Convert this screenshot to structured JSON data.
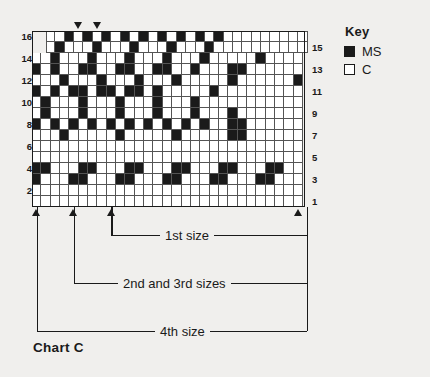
{
  "key": {
    "title": "Key",
    "items": [
      {
        "swatch": "ms",
        "label": "MS"
      },
      {
        "swatch": "c",
        "label": "C"
      }
    ]
  },
  "caption": "Chart C",
  "brackets": [
    {
      "label": "1st size"
    },
    {
      "label": "2nd and 3rd sizes"
    },
    {
      "label": "4th size"
    }
  ],
  "chart_data": {
    "type": "heatmap",
    "title": "Chart C",
    "xlabel": "",
    "ylabel": "",
    "columns": 29,
    "rows": 16,
    "legend_position": "right",
    "grid": true,
    "colors": {
      "ms": "#1a1a1a",
      "c": "#ffffff",
      "gridline": "#545454"
    },
    "row_labels_left": [
      "16",
      "14",
      "12",
      "10",
      "8",
      "6",
      "4",
      "2"
    ],
    "row_labels_right": [
      "15",
      "13",
      "11",
      "9",
      "7",
      "5",
      "3",
      "1"
    ],
    "cell_values": {
      "16": [
        0,
        0,
        1,
        0,
        1,
        0,
        1,
        0,
        1,
        0,
        1,
        0,
        1,
        0,
        1,
        0,
        1,
        0,
        1,
        0,
        0,
        0,
        0,
        0,
        0,
        0,
        0,
        0,
        0
      ],
      "15": [
        0,
        1,
        0,
        0,
        0,
        1,
        0,
        0,
        0,
        1,
        0,
        0,
        0,
        1,
        0,
        0,
        0,
        1,
        0,
        0,
        0,
        0,
        0,
        0,
        0,
        0,
        0,
        0,
        0
      ],
      "14": [
        0,
        0,
        1,
        0,
        0,
        0,
        1,
        0,
        0,
        0,
        1,
        0,
        0,
        0,
        1,
        0,
        0,
        0,
        1,
        0,
        0,
        0,
        0,
        0,
        1,
        0,
        0,
        0,
        0
      ],
      "13": [
        1,
        0,
        1,
        0,
        0,
        1,
        1,
        0,
        0,
        1,
        1,
        0,
        0,
        1,
        1,
        0,
        0,
        1,
        0,
        0,
        0,
        1,
        1,
        0,
        0,
        0,
        0,
        0,
        0
      ],
      "12": [
        0,
        0,
        0,
        1,
        0,
        0,
        0,
        1,
        0,
        0,
        0,
        1,
        0,
        0,
        0,
        1,
        0,
        0,
        0,
        0,
        0,
        1,
        0,
        0,
        0,
        0,
        0,
        0,
        1
      ],
      "11": [
        1,
        0,
        1,
        0,
        1,
        1,
        0,
        1,
        1,
        0,
        1,
        1,
        0,
        1,
        0,
        0,
        0,
        0,
        0,
        1,
        0,
        0,
        0,
        0,
        0,
        0,
        0,
        0,
        0
      ],
      "10": [
        0,
        1,
        0,
        0,
        0,
        1,
        0,
        0,
        0,
        1,
        0,
        0,
        0,
        1,
        0,
        0,
        0,
        1,
        0,
        0,
        0,
        0,
        0,
        0,
        0,
        0,
        0,
        0,
        0
      ],
      "9": [
        0,
        1,
        0,
        0,
        0,
        1,
        0,
        0,
        0,
        1,
        0,
        0,
        0,
        1,
        0,
        0,
        0,
        1,
        0,
        0,
        0,
        1,
        0,
        0,
        0,
        0,
        0,
        0,
        0
      ],
      "8": [
        1,
        0,
        1,
        0,
        1,
        0,
        1,
        0,
        1,
        0,
        1,
        0,
        1,
        0,
        1,
        0,
        1,
        0,
        1,
        0,
        0,
        1,
        1,
        0,
        0,
        0,
        0,
        0,
        0
      ],
      "7": [
        0,
        0,
        0,
        1,
        0,
        0,
        0,
        0,
        0,
        1,
        0,
        0,
        0,
        0,
        0,
        1,
        0,
        0,
        0,
        0,
        0,
        1,
        1,
        0,
        0,
        0,
        0,
        0,
        0
      ],
      "6": [
        0,
        0,
        0,
        0,
        0,
        0,
        0,
        0,
        0,
        0,
        0,
        0,
        0,
        0,
        0,
        0,
        0,
        0,
        0,
        0,
        0,
        0,
        0,
        0,
        0,
        0,
        0,
        0,
        0
      ],
      "5": [
        0,
        0,
        0,
        0,
        0,
        0,
        0,
        0,
        0,
        0,
        0,
        0,
        0,
        0,
        0,
        0,
        0,
        0,
        0,
        0,
        0,
        0,
        0,
        0,
        0,
        0,
        0,
        0,
        0
      ],
      "4": [
        1,
        1,
        0,
        0,
        0,
        1,
        1,
        0,
        0,
        0,
        1,
        1,
        0,
        0,
        0,
        1,
        1,
        0,
        0,
        0,
        1,
        1,
        0,
        0,
        0,
        1,
        1,
        0,
        0
      ],
      "3": [
        1,
        0,
        0,
        0,
        1,
        1,
        0,
        0,
        0,
        1,
        1,
        0,
        0,
        0,
        1,
        1,
        0,
        0,
        0,
        1,
        1,
        0,
        0,
        0,
        1,
        1,
        0,
        0,
        0
      ],
      "2": [
        0,
        0,
        0,
        0,
        0,
        0,
        0,
        0,
        0,
        0,
        0,
        0,
        0,
        0,
        0,
        0,
        0,
        0,
        0,
        0,
        0,
        0,
        0,
        0,
        0,
        0,
        0,
        0,
        0
      ],
      "1": [
        0,
        0,
        0,
        0,
        0,
        0,
        0,
        0,
        0,
        0,
        0,
        0,
        0,
        0,
        0,
        0,
        0,
        0,
        0,
        0,
        0,
        0,
        0,
        0,
        0,
        0,
        0,
        0,
        0
      ]
    },
    "row_order": [
      "16",
      "15",
      "14",
      "13",
      "12",
      "11",
      "10",
      "9",
      "8",
      "7",
      "6",
      "5",
      "4",
      "3",
      "2",
      "1"
    ],
    "top_markers": [
      3,
      5
    ],
    "bottom_markers": [
      0,
      4,
      8,
      28
    ]
  }
}
